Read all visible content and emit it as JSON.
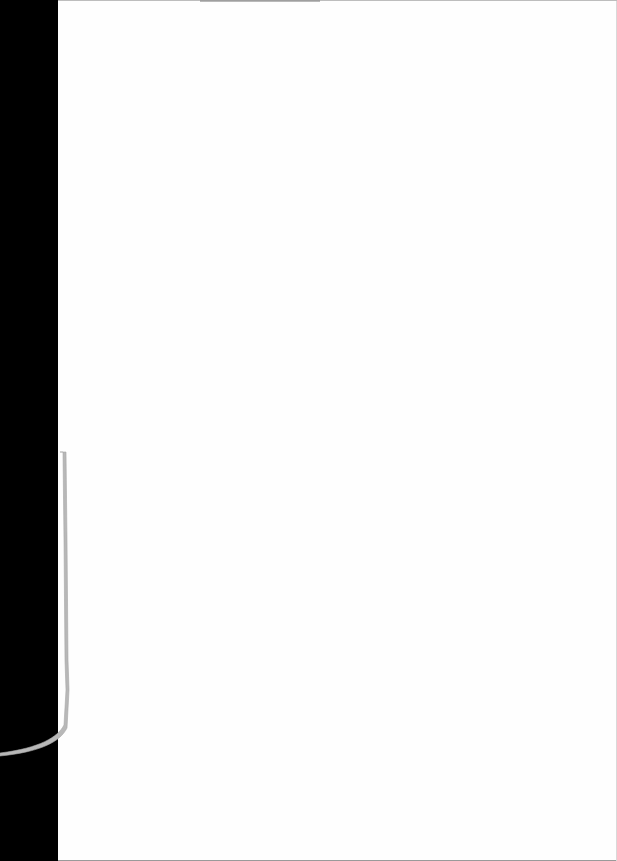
{
  "document": {
    "type": "scanned-page",
    "content": "",
    "colors": {
      "background": "#000000",
      "paper": "#fefefe",
      "binding_strip": "#b8b8b8"
    }
  }
}
